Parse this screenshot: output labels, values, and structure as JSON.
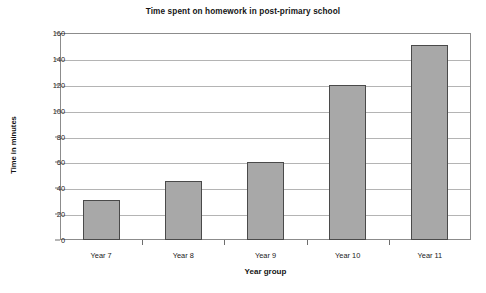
{
  "chart_data": {
    "type": "bar",
    "title": "Time spent on homework in post-primary school",
    "xlabel": "Year group",
    "ylabel": "Time in minutes",
    "categories": [
      "Year 7",
      "Year 8",
      "Year 9",
      "Year 10",
      "Year 11"
    ],
    "values": [
      31,
      46,
      60,
      120,
      151
    ],
    "ylim": [
      0,
      160
    ],
    "ytick_step": 20,
    "yticks": [
      0,
      20,
      40,
      60,
      80,
      100,
      120,
      140,
      160
    ],
    "ytick_labels": [
      "0",
      "20",
      "40",
      "60",
      "80",
      "100",
      "120",
      "140",
      "160"
    ],
    "grid": true,
    "grid_axis": "y",
    "legend": false,
    "legend_position": "none",
    "series": [
      {
        "name": "Time spent on homework",
        "values": [
          31,
          46,
          60,
          120,
          151
        ]
      }
    ],
    "colors": {
      "bar_fill": "#a8a8a8",
      "bar_border": "#4a4a4a",
      "gridline": "#b4b4b4",
      "frame": "#8c8c8c",
      "text": "#1a1a1a",
      "background": "#ffffff"
    }
  }
}
